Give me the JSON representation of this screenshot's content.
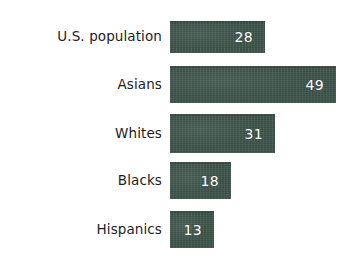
{
  "chart_data": {
    "type": "bar",
    "orientation": "horizontal",
    "title": "",
    "subtitle": "",
    "xlabel": "",
    "ylabel": "",
    "grid": false,
    "legend": "none",
    "xlim": [
      0,
      49
    ],
    "categories": [
      "U.S. population",
      "Asians",
      "Whites",
      "Blacks",
      "Hispanics"
    ],
    "values": [
      28,
      49,
      31,
      18,
      13
    ],
    "value_labels": [
      "28",
      "49",
      "31",
      "18",
      "13"
    ],
    "series": [
      {
        "name": "",
        "values": [
          28,
          49,
          31,
          18,
          13
        ]
      }
    ],
    "bars": [
      {
        "category": "U.S. population",
        "value": 28,
        "label": "28"
      },
      {
        "category": "Asians",
        "value": 49,
        "label": "49"
      },
      {
        "category": "Whites",
        "value": 31,
        "label": "31"
      },
      {
        "category": "Blacks",
        "value": 18,
        "label": "18"
      },
      {
        "category": "Hispanics",
        "value": 13,
        "label": "13"
      }
    ]
  },
  "style": {
    "bar_color": "#3c5349",
    "value_text_color": "#ffffff",
    "label_text_color": "#1d1d1d",
    "background_color": "#ffffff"
  },
  "layout": {
    "bar_origin_x": 170,
    "px_per_unit": 3.39,
    "rows": [
      {
        "top": 21,
        "height": 32
      },
      {
        "top": 66,
        "height": 37
      },
      {
        "top": 114,
        "height": 39
      },
      {
        "top": 162,
        "height": 37
      },
      {
        "top": 211,
        "height": 37
      }
    ]
  }
}
